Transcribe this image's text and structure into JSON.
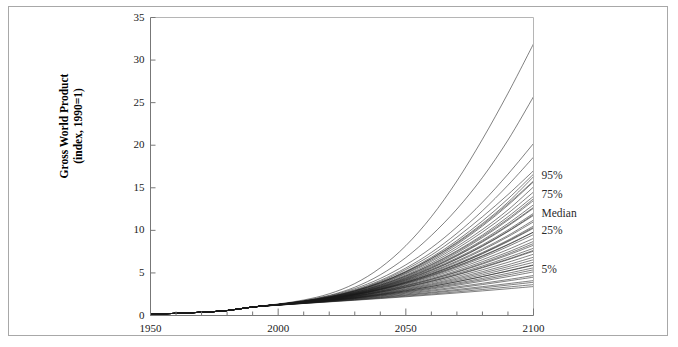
{
  "chart_data": {
    "type": "line",
    "title": "",
    "subtitle": "",
    "xlabel": "",
    "ylabel": "Gross World Product (index, 1990=1)",
    "ylabel_line1": "Gross World Product",
    "ylabel_line2": "(index, 1990=1)",
    "xlim": [
      1950,
      2100
    ],
    "ylim": [
      0,
      35
    ],
    "x_ticks_major": [
      1950,
      2000,
      2050,
      2100
    ],
    "x_tick_labels": [
      "1950",
      "2000",
      "2050",
      "2100"
    ],
    "x_minor_tick_step": 10,
    "y_ticks": [
      0,
      5,
      10,
      15,
      20,
      25,
      30,
      35
    ],
    "y_tick_labels": [
      "0",
      "5",
      "10",
      "15",
      "20",
      "25",
      "30",
      "35"
    ],
    "grid": false,
    "legend_position": "right-inline",
    "line_color": "#1a1a1a",
    "frame_color": "#a8a8a8",
    "annotations": [
      {
        "label": "95%",
        "value": 16.3,
        "x": 2100
      },
      {
        "label": "75%",
        "value": 14.0,
        "x": 2100
      },
      {
        "label": "Median",
        "value": 11.8,
        "x": 2100
      },
      {
        "label": "25%",
        "value": 9.8,
        "x": 2100
      },
      {
        "label": "5%",
        "value": 5.2,
        "x": 2100
      }
    ],
    "x": [
      1950,
      1960,
      1970,
      1980,
      1990,
      2000,
      2010,
      2020,
      2030,
      2040,
      2050,
      2060,
      2070,
      2080,
      2090,
      2100
    ],
    "series": [
      {
        "name": "scenario-01",
        "values": [
          0.18,
          0.25,
          0.38,
          0.58,
          1.0,
          1.35,
          1.82,
          2.55,
          3.75,
          5.6,
          8.2,
          11.6,
          15.8,
          20.7,
          26.1,
          31.9
        ]
      },
      {
        "name": "scenario-02",
        "values": [
          0.18,
          0.25,
          0.38,
          0.58,
          1.0,
          1.32,
          1.74,
          2.36,
          3.32,
          4.78,
          6.8,
          9.4,
          12.5,
          16.2,
          20.6,
          25.7
        ]
      },
      {
        "name": "scenario-03",
        "values": [
          0.18,
          0.25,
          0.38,
          0.58,
          1.0,
          1.3,
          1.68,
          2.2,
          2.95,
          4.0,
          5.4,
          7.1,
          9.2,
          11.6,
          14.2,
          17.0
        ]
      },
      {
        "name": "scenario-04",
        "values": [
          0.18,
          0.25,
          0.38,
          0.58,
          1.0,
          1.3,
          1.66,
          2.16,
          2.86,
          3.84,
          5.12,
          6.7,
          8.6,
          10.8,
          13.3,
          16.3
        ]
      },
      {
        "name": "scenario-05",
        "values": [
          0.18,
          0.25,
          0.38,
          0.58,
          1.0,
          1.29,
          1.64,
          2.12,
          2.78,
          3.7,
          4.9,
          6.35,
          8.1,
          10.1,
          12.4,
          15.1
        ]
      },
      {
        "name": "scenario-06",
        "values": [
          0.18,
          0.25,
          0.38,
          0.58,
          1.0,
          1.29,
          1.63,
          2.08,
          2.7,
          3.56,
          4.66,
          6.0,
          7.6,
          9.45,
          11.6,
          14.0
        ]
      },
      {
        "name": "scenario-07",
        "values": [
          0.18,
          0.25,
          0.38,
          0.58,
          1.0,
          1.28,
          1.61,
          2.04,
          2.63,
          3.43,
          4.45,
          5.7,
          7.15,
          8.85,
          10.8,
          13.0
        ]
      },
      {
        "name": "scenario-08",
        "values": [
          0.18,
          0.25,
          0.38,
          0.58,
          1.0,
          1.28,
          1.6,
          2.01,
          2.56,
          3.31,
          4.26,
          5.42,
          6.76,
          8.3,
          10.05,
          12.0
        ]
      },
      {
        "name": "scenario-09",
        "values": [
          0.18,
          0.25,
          0.38,
          0.58,
          1.0,
          1.28,
          1.59,
          1.98,
          2.5,
          3.2,
          4.08,
          5.15,
          6.4,
          7.82,
          9.4,
          11.2
        ]
      },
      {
        "name": "scenario-10",
        "values": [
          0.18,
          0.25,
          0.38,
          0.58,
          1.0,
          1.27,
          1.58,
          1.96,
          2.46,
          3.12,
          3.95,
          4.95,
          6.1,
          7.4,
          8.85,
          10.5
        ]
      },
      {
        "name": "scenario-11",
        "values": [
          0.18,
          0.25,
          0.38,
          0.58,
          1.0,
          1.27,
          1.57,
          1.94,
          2.42,
          3.04,
          3.82,
          4.75,
          5.82,
          7.02,
          8.35,
          9.8
        ]
      },
      {
        "name": "scenario-12",
        "values": [
          0.18,
          0.25,
          0.38,
          0.58,
          1.0,
          1.27,
          1.56,
          1.91,
          2.36,
          2.94,
          3.65,
          4.5,
          5.48,
          6.55,
          7.75,
          9.05
        ]
      },
      {
        "name": "scenario-13",
        "values": [
          0.18,
          0.25,
          0.38,
          0.58,
          1.0,
          1.26,
          1.54,
          1.87,
          2.29,
          2.82,
          3.46,
          4.22,
          5.08,
          6.04,
          7.1,
          8.25
        ]
      },
      {
        "name": "scenario-14",
        "values": [
          0.18,
          0.25,
          0.38,
          0.58,
          1.0,
          1.26,
          1.53,
          1.84,
          2.23,
          2.72,
          3.3,
          3.98,
          4.75,
          5.6,
          6.55,
          7.55
        ]
      },
      {
        "name": "scenario-15",
        "values": [
          0.18,
          0.25,
          0.38,
          0.58,
          1.0,
          1.25,
          1.51,
          1.8,
          2.16,
          2.6,
          3.12,
          3.72,
          4.4,
          5.15,
          5.96,
          6.85
        ]
      },
      {
        "name": "scenario-16",
        "values": [
          0.18,
          0.25,
          0.38,
          0.58,
          1.0,
          1.25,
          1.5,
          1.78,
          2.11,
          2.51,
          2.98,
          3.52,
          4.12,
          4.78,
          5.5,
          6.25
        ]
      },
      {
        "name": "scenario-17",
        "values": [
          0.18,
          0.25,
          0.38,
          0.58,
          1.0,
          1.24,
          1.48,
          1.74,
          2.04,
          2.4,
          2.81,
          3.28,
          3.8,
          4.36,
          4.96,
          5.6
        ]
      },
      {
        "name": "scenario-18",
        "values": [
          0.18,
          0.25,
          0.38,
          0.58,
          1.0,
          1.24,
          1.47,
          1.72,
          2.0,
          2.32,
          2.69,
          3.1,
          3.55,
          4.04,
          4.56,
          5.12
        ]
      },
      {
        "name": "scenario-19",
        "values": [
          0.18,
          0.25,
          0.38,
          0.58,
          1.0,
          1.23,
          1.45,
          1.68,
          1.93,
          2.21,
          2.52,
          2.86,
          3.23,
          3.63,
          4.06,
          4.5
        ]
      },
      {
        "name": "scenario-20",
        "values": [
          0.18,
          0.25,
          0.38,
          0.58,
          1.0,
          1.22,
          1.43,
          1.64,
          1.86,
          2.1,
          2.36,
          2.64,
          2.93,
          3.24,
          3.57,
          3.9
        ]
      },
      {
        "name": "scenario-21",
        "values": [
          0.18,
          0.25,
          0.38,
          0.58,
          1.0,
          1.21,
          1.41,
          1.6,
          1.79,
          1.99,
          2.2,
          2.42,
          2.65,
          2.89,
          3.14,
          3.4
        ]
      },
      {
        "name": "scenario-22",
        "values": [
          0.18,
          0.25,
          0.38,
          0.58,
          1.0,
          1.3,
          1.69,
          2.24,
          3.02,
          4.12,
          5.58,
          7.4,
          9.65,
          12.3,
          15.3,
          18.6
        ]
      },
      {
        "name": "scenario-23",
        "values": [
          0.18,
          0.25,
          0.38,
          0.58,
          1.0,
          1.29,
          1.65,
          2.14,
          2.82,
          3.77,
          4.99,
          6.5,
          8.35,
          10.5,
          12.95,
          15.7
        ]
      },
      {
        "name": "scenario-24",
        "values": [
          0.18,
          0.25,
          0.38,
          0.58,
          1.0,
          1.29,
          1.64,
          2.1,
          2.74,
          3.62,
          4.76,
          6.16,
          7.85,
          9.8,
          12.0,
          14.5
        ]
      },
      {
        "name": "scenario-25",
        "values": [
          0.18,
          0.25,
          0.38,
          0.58,
          1.0,
          1.28,
          1.62,
          2.06,
          2.66,
          3.48,
          4.53,
          5.82,
          7.35,
          9.15,
          11.2,
          13.5
        ]
      },
      {
        "name": "scenario-26",
        "values": [
          0.18,
          0.25,
          0.38,
          0.58,
          1.0,
          1.28,
          1.6,
          2.02,
          2.58,
          3.35,
          4.33,
          5.55,
          6.98,
          8.63,
          10.5,
          12.6
        ]
      },
      {
        "name": "scenario-27",
        "values": [
          0.18,
          0.25,
          0.38,
          0.58,
          1.0,
          1.28,
          1.59,
          1.99,
          2.52,
          3.24,
          4.15,
          5.28,
          6.6,
          8.12,
          9.85,
          11.75
        ]
      },
      {
        "name": "scenario-28",
        "values": [
          0.18,
          0.25,
          0.38,
          0.58,
          1.0,
          1.27,
          1.58,
          1.97,
          2.48,
          3.16,
          4.02,
          5.06,
          6.28,
          7.68,
          9.25,
          11.0
        ]
      },
      {
        "name": "scenario-29",
        "values": [
          0.18,
          0.25,
          0.38,
          0.58,
          1.0,
          1.27,
          1.57,
          1.95,
          2.44,
          3.08,
          3.88,
          4.85,
          5.97,
          7.25,
          8.68,
          10.25
        ]
      },
      {
        "name": "scenario-30",
        "values": [
          0.18,
          0.25,
          0.38,
          0.58,
          1.0,
          1.27,
          1.56,
          1.92,
          2.39,
          2.99,
          3.73,
          4.62,
          5.65,
          6.8,
          8.1,
          9.5
        ]
      },
      {
        "name": "scenario-31",
        "values": [
          0.18,
          0.25,
          0.38,
          0.58,
          1.0,
          1.26,
          1.55,
          1.89,
          2.33,
          2.88,
          3.56,
          4.36,
          5.28,
          6.32,
          7.45,
          8.7
        ]
      },
      {
        "name": "scenario-32",
        "values": [
          0.18,
          0.25,
          0.38,
          0.58,
          1.0,
          1.26,
          1.54,
          1.86,
          2.26,
          2.77,
          3.38,
          4.1,
          4.92,
          5.82,
          6.82,
          7.9
        ]
      },
      {
        "name": "scenario-33",
        "values": [
          0.18,
          0.25,
          0.38,
          0.58,
          1.0,
          1.25,
          1.52,
          1.82,
          2.19,
          2.66,
          3.21,
          3.85,
          4.57,
          5.37,
          6.25,
          7.2
        ]
      },
      {
        "name": "scenario-34",
        "values": [
          0.18,
          0.25,
          0.38,
          0.58,
          1.0,
          1.25,
          1.51,
          1.79,
          2.13,
          2.55,
          3.05,
          3.62,
          4.26,
          4.97,
          5.73,
          6.55
        ]
      },
      {
        "name": "scenario-35",
        "values": [
          0.18,
          0.25,
          0.38,
          0.58,
          1.0,
          1.24,
          1.49,
          1.76,
          2.07,
          2.45,
          2.89,
          3.4,
          3.96,
          4.57,
          5.22,
          5.9
        ]
      },
      {
        "name": "scenario-36",
        "values": [
          0.18,
          0.25,
          0.38,
          0.58,
          1.0,
          1.24,
          1.47,
          1.71,
          1.98,
          2.28,
          2.61,
          2.97,
          3.36,
          3.78,
          4.22,
          4.7
        ]
      },
      {
        "name": "scenario-37",
        "values": [
          0.18,
          0.25,
          0.38,
          0.58,
          1.0,
          1.23,
          1.44,
          1.66,
          1.9,
          2.15,
          2.43,
          2.73,
          3.05,
          3.39,
          3.74,
          4.1
        ]
      },
      {
        "name": "scenario-38",
        "values": [
          0.18,
          0.25,
          0.38,
          0.58,
          1.0,
          1.3,
          1.72,
          2.3,
          3.15,
          4.35,
          5.95,
          7.95,
          10.4,
          13.3,
          16.6,
          20.2
        ]
      },
      {
        "name": "scenario-39",
        "values": [
          0.18,
          0.25,
          0.38,
          0.58,
          1.0,
          1.29,
          1.67,
          2.18,
          2.9,
          3.9,
          5.2,
          6.83,
          8.8,
          11.1,
          13.7,
          16.6
        ]
      },
      {
        "name": "scenario-40",
        "values": [
          0.18,
          0.25,
          0.38,
          0.58,
          1.0,
          1.28,
          1.63,
          2.09,
          2.7,
          3.55,
          4.62,
          5.94,
          7.5,
          9.3,
          11.35,
          13.7
        ]
      },
      {
        "name": "scenario-41",
        "values": [
          0.18,
          0.25,
          0.38,
          0.58,
          1.0,
          1.28,
          1.6,
          2.0,
          2.54,
          3.28,
          4.2,
          5.33,
          6.65,
          8.18,
          9.9,
          11.85
        ]
      },
      {
        "name": "scenario-42",
        "values": [
          0.18,
          0.25,
          0.38,
          0.58,
          1.0,
          1.27,
          1.57,
          1.93,
          2.41,
          3.03,
          3.79,
          4.7,
          5.76,
          6.96,
          8.3,
          9.78
        ]
      },
      {
        "name": "scenario-43",
        "values": [
          0.18,
          0.25,
          0.38,
          0.58,
          1.0,
          1.26,
          1.54,
          1.85,
          2.24,
          2.74,
          3.33,
          4.02,
          4.8,
          5.67,
          6.62,
          7.65
        ]
      },
      {
        "name": "scenario-44",
        "values": [
          0.18,
          0.25,
          0.38,
          0.58,
          1.0,
          1.25,
          1.5,
          1.77,
          2.09,
          2.47,
          2.91,
          3.41,
          3.97,
          4.58,
          5.25,
          5.95
        ]
      },
      {
        "name": "scenario-45",
        "values": [
          0.18,
          0.25,
          0.38,
          0.58,
          1.0,
          1.22,
          1.42,
          1.62,
          1.82,
          2.04,
          2.27,
          2.52,
          2.78,
          3.05,
          3.34,
          3.63
        ]
      },
      {
        "name": "scenario-46",
        "values": [
          0.18,
          0.25,
          0.38,
          0.58,
          1.0,
          1.29,
          1.66,
          2.17,
          2.88,
          3.85,
          5.1,
          6.65,
          8.5,
          10.65,
          13.1,
          15.8
        ]
      },
      {
        "name": "scenario-47",
        "values": [
          0.18,
          0.25,
          0.38,
          0.58,
          1.0,
          1.28,
          1.61,
          2.03,
          2.6,
          3.38,
          4.38,
          5.6,
          7.05,
          8.72,
          10.6,
          12.7
        ]
      },
      {
        "name": "scenario-48",
        "values": [
          0.18,
          0.25,
          0.38,
          0.58,
          1.0,
          1.27,
          1.58,
          1.95,
          2.45,
          3.1,
          3.9,
          4.87,
          6.0,
          7.3,
          8.75,
          10.35
        ]
      },
      {
        "name": "scenario-49",
        "values": [
          0.18,
          0.25,
          0.38,
          0.58,
          1.0,
          1.26,
          1.55,
          1.88,
          2.3,
          2.85,
          3.5,
          4.26,
          5.14,
          6.14,
          7.25,
          8.45
        ]
      },
      {
        "name": "scenario-50",
        "values": [
          0.18,
          0.25,
          0.38,
          0.58,
          1.0,
          1.24,
          1.48,
          1.75,
          2.04,
          2.38,
          2.77,
          3.2,
          3.68,
          4.2,
          4.76,
          5.36
        ]
      }
    ]
  }
}
